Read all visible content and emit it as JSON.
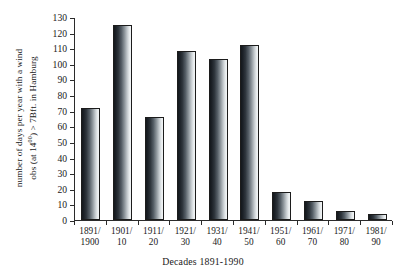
{
  "chart_data": {
    "type": "bar",
    "title": "",
    "subtitle": "",
    "xlabel": "Decades 1891-1990",
    "ylabel_line1": "number of days per year with a wind",
    "ylabel_line2_pre": "obs (at 14",
    "ylabel_line2_sup": "00",
    "ylabel_line2_post": ") > 7Bft. in Hamburg",
    "ylabel_full": "number of days per year with a wind obs (at 14⁰⁰) > 7Bft. in Hamburg",
    "categories": [
      "1891/1900",
      "1901/10",
      "1911/20",
      "1921/30",
      "1931/40",
      "1941/50",
      "1951/60",
      "1961/70",
      "1971/80",
      "1981/90"
    ],
    "category_lines": [
      [
        "1891/",
        "1900"
      ],
      [
        "1901/",
        "10"
      ],
      [
        "1911/",
        "20"
      ],
      [
        "1921/",
        "30"
      ],
      [
        "1931/",
        "40"
      ],
      [
        "1941/",
        "50"
      ],
      [
        "1951/",
        "60"
      ],
      [
        "1961/",
        "70"
      ],
      [
        "1971/",
        "80"
      ],
      [
        "1981/",
        "90"
      ]
    ],
    "values": [
      72,
      125,
      66,
      108,
      103,
      112,
      18,
      12,
      6,
      4
    ],
    "ylim": [
      0,
      130
    ],
    "yticks": [
      0,
      10,
      20,
      30,
      40,
      50,
      60,
      70,
      80,
      90,
      100,
      110,
      120,
      130
    ],
    "ytick_labels": [
      "0",
      "10",
      "20",
      "30",
      "40",
      "50",
      "60",
      "70",
      "80",
      "90",
      "100",
      "110",
      "120",
      "130"
    ],
    "grid": false,
    "legend": null,
    "bar_style": {
      "fill": "horizontal-gradient-dark-to-light",
      "edge_color": "#1c1c1c",
      "dark_color": "#14181c",
      "light_color": "#f2f5f6"
    }
  }
}
